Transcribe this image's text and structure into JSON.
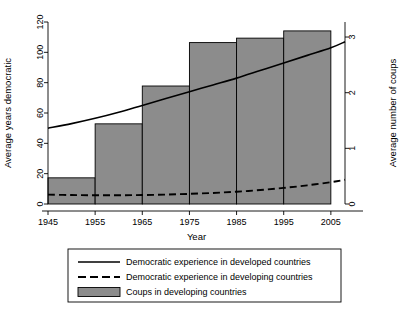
{
  "chart_data": {
    "type": "bar",
    "title": "",
    "subtitle": "",
    "xlabel": "Year",
    "ylabel": "Average years democratic",
    "y2label": "Average number of coups",
    "grid": false,
    "legend_position": "bottom",
    "xlim": [
      1945,
      2008
    ],
    "ylim": [
      0,
      125
    ],
    "y2lim": [
      0,
      3.27
    ],
    "xticks": [
      "1945",
      "1955",
      "1965",
      "1975",
      "1985",
      "1995",
      "2005"
    ],
    "xtick_values": [
      1945,
      1955,
      1965,
      1975,
      1985,
      1995,
      2005
    ],
    "yticks": [
      "0",
      "20",
      "40",
      "60",
      "80",
      "100",
      "120"
    ],
    "ytick_values": [
      0,
      20,
      40,
      60,
      80,
      100,
      120
    ],
    "y2ticks": [
      "0",
      "1",
      "2",
      "3"
    ],
    "y2tick_values": [
      0,
      1,
      2,
      3
    ],
    "bars": {
      "name": "Coups in developing countries",
      "axis": "right",
      "fill_color": "#8c8c8c",
      "edge_color": "#000000",
      "categories": [
        "1945-1955",
        "1955-1965",
        "1965-1975",
        "1975-1985",
        "1985-1995",
        "1995-2005"
      ],
      "x_start": [
        1945,
        1955,
        1965,
        1975,
        1985,
        1995
      ],
      "x_end": [
        1955,
        1965,
        1975,
        1985,
        1995,
        2005
      ],
      "values": [
        0.47,
        1.44,
        2.12,
        2.9,
        2.98,
        3.11
      ],
      "values_left_axis": [
        18,
        55,
        81,
        111,
        114,
        119
      ]
    },
    "series": [
      {
        "name": "Democratic experience in developed countries",
        "type": "line",
        "style": "solid",
        "color": "#000000",
        "axis": "left",
        "x": [
          1945,
          1950,
          1955,
          1960,
          1965,
          1970,
          1975,
          1980,
          1985,
          1990,
          1995,
          2000,
          2005,
          2008
        ],
        "values": [
          50,
          53,
          56.5,
          60.5,
          65,
          69.5,
          74,
          78.5,
          83,
          88,
          93,
          98,
          103,
          107
        ]
      },
      {
        "name": "Democratic experience in developing countries",
        "type": "line",
        "style": "dashed",
        "color": "#000000",
        "axis": "left",
        "x": [
          1945,
          1950,
          1955,
          1960,
          1965,
          1970,
          1975,
          1980,
          1985,
          1990,
          1995,
          2000,
          2005,
          2008
        ],
        "values": [
          6.2,
          5.9,
          5.8,
          5.8,
          5.9,
          6.2,
          6.7,
          7.3,
          8.1,
          9.2,
          10.6,
          12.3,
          14.4,
          16.0
        ]
      }
    ],
    "legend": [
      {
        "label": "Democratic experience in developed countries",
        "marker": "solid-line"
      },
      {
        "label": "Democratic experience in developing countries",
        "marker": "dashed-line"
      },
      {
        "label": "Coups in developing countries",
        "marker": "filled-box"
      }
    ]
  }
}
